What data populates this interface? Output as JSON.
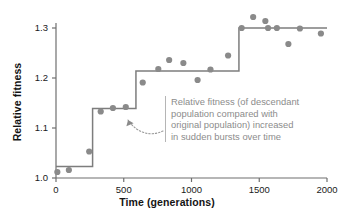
{
  "chart_data": {
    "type": "scatter",
    "title": "",
    "xlabel": "Time (generations)",
    "ylabel": "Relative fitness",
    "xlim": [
      0,
      2000
    ],
    "ylim": [
      1.0,
      1.31
    ],
    "xticks": [
      0,
      500,
      1000,
      1500,
      2000
    ],
    "xticklabels": [
      "0",
      "500",
      "1000",
      "1500",
      "2000"
    ],
    "yticks": [
      1.0,
      1.1,
      1.2,
      1.3
    ],
    "yticklabels": [
      "1.0",
      "1.1",
      "1.2",
      "1.3"
    ],
    "grid": false,
    "legend": null,
    "series": [
      {
        "name": "Relative fitness measurements",
        "type": "scatter",
        "marker": "circle",
        "color": "#8a8a8a",
        "points": [
          {
            "x": 10,
            "y": 1.012
          },
          {
            "x": 95,
            "y": 1.016
          },
          {
            "x": 245,
            "y": 1.053
          },
          {
            "x": 330,
            "y": 1.133
          },
          {
            "x": 420,
            "y": 1.14
          },
          {
            "x": 515,
            "y": 1.142
          },
          {
            "x": 640,
            "y": 1.191
          },
          {
            "x": 755,
            "y": 1.218
          },
          {
            "x": 835,
            "y": 1.236
          },
          {
            "x": 940,
            "y": 1.23
          },
          {
            "x": 1045,
            "y": 1.196
          },
          {
            "x": 1140,
            "y": 1.217
          },
          {
            "x": 1270,
            "y": 1.245
          },
          {
            "x": 1370,
            "y": 1.3
          },
          {
            "x": 1455,
            "y": 1.322
          },
          {
            "x": 1545,
            "y": 1.314
          },
          {
            "x": 1565,
            "y": 1.3
          },
          {
            "x": 1630,
            "y": 1.3
          },
          {
            "x": 1715,
            "y": 1.268
          },
          {
            "x": 1800,
            "y": 1.299
          },
          {
            "x": 1955,
            "y": 1.289
          }
        ]
      },
      {
        "name": "Step fit",
        "type": "step",
        "color": "#7d7d7d",
        "steps": [
          {
            "x_start": 0,
            "x_end": 270,
            "y": 1.023
          },
          {
            "x_start": 270,
            "x_end": 590,
            "y": 1.139
          },
          {
            "x_start": 590,
            "x_end": 1350,
            "y": 1.214
          },
          {
            "x_start": 1350,
            "x_end": 2000,
            "y": 1.3
          }
        ]
      }
    ],
    "annotations": [
      {
        "name": "step-burst-note",
        "lines": [
          "Relative fitness (of descendant",
          "population compared with",
          "original population) increased",
          "in sudden bursts over time"
        ],
        "text": "Relative fitness (of descendant population compared with original population) increased in sudden bursts over time",
        "color": "#8c8c8c",
        "arrow": "dotted-curve-pointing-to-step"
      }
    ]
  },
  "axes": {
    "ylabel": "Relative fitness",
    "xlabel": "Time (generations)",
    "ytick_labels": [
      "1.3",
      "1.2",
      "1.1",
      "1.0"
    ],
    "xtick_labels": [
      "0",
      "500",
      "1000",
      "1500",
      "2000"
    ]
  },
  "colors": {
    "marker": "#8a8a8a",
    "step_line": "#7d7d7d",
    "axis": "#6f6f6f",
    "annotation_text": "#8c8c8c",
    "annotation_rule": "#b5b5b5",
    "background": "#ffffff"
  }
}
